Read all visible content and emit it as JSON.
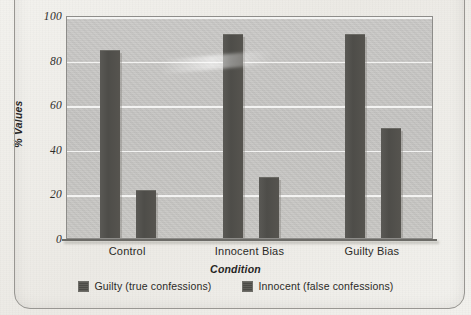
{
  "chart_data": {
    "type": "bar",
    "title": "",
    "xlabel": "Condition",
    "ylabel": "% Values",
    "categories": [
      "Control",
      "Innocent Bias",
      "Guilty Bias"
    ],
    "series": [
      {
        "name": "Guilty (true confessions)",
        "values": [
          84,
          91,
          91
        ]
      },
      {
        "name": "Innocent (false confessions)",
        "values": [
          21,
          27,
          49
        ]
      }
    ],
    "ylim": [
      0,
      100
    ],
    "yticks": [
      0,
      20,
      40,
      60,
      80,
      100
    ],
    "ytick_labels": [
      "0",
      "20",
      "40",
      "60",
      "80",
      "100"
    ],
    "grid": true,
    "legend_position": "bottom",
    "bar_color": "#4e4d49",
    "plot_background": "#c6c5c2",
    "page_background": "#efeeea"
  },
  "legend": {
    "items": [
      {
        "label": "Guilty (true confessions)"
      },
      {
        "label": "Innocent (false confessions)"
      }
    ]
  },
  "ghost_text": {
    "top": "",
    "middle": ""
  }
}
